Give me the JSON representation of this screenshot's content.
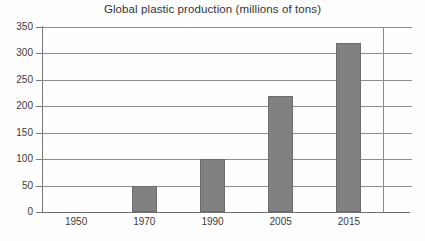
{
  "chart_data": {
    "type": "bar",
    "title": "Global plastic production (millions of tons)",
    "xlabel": "",
    "ylabel": "",
    "categories": [
      "1950",
      "1970",
      "1990",
      "2005",
      "2015"
    ],
    "values": [
      0,
      50,
      100,
      220,
      320
    ],
    "ylim": [
      0,
      350
    ],
    "ytick_values": [
      0,
      50,
      100,
      150,
      200,
      250,
      300,
      350
    ],
    "ytick_labels": [
      "0",
      "50",
      "100",
      "150",
      "200",
      "250",
      "300",
      "350"
    ],
    "grid": true,
    "legend": null,
    "series": [
      {
        "name": "Global plastic production",
        "values": [
          0,
          50,
          100,
          220,
          320
        ]
      }
    ],
    "bar_color": "#818181",
    "axis_color": "#7a7a7a",
    "text_color": "#333333",
    "background_color": "#ffffff"
  }
}
